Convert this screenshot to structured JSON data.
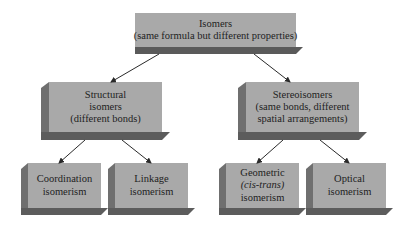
{
  "diagram": {
    "root": {
      "title": "Isomers",
      "subtitle": "(same formula but different properties)"
    },
    "structural": {
      "line1": "Structural",
      "line2": "isomers",
      "line3": "(different bonds)"
    },
    "stereo": {
      "line1": "Stereoisomers",
      "line2": "(same bonds, different",
      "line3": "spatial arrangements)"
    },
    "coordination": {
      "line1": "Coordination",
      "line2": "isomerism"
    },
    "linkage": {
      "line1": "Linkage",
      "line2": "isomerism"
    },
    "geometric": {
      "line1": "Geometric",
      "line2": "(cis-trans)",
      "line3": "isomerism"
    },
    "optical": {
      "line1": "Optical",
      "line2": "isomerism"
    },
    "edges": [
      {
        "from": "root",
        "to": "structural"
      },
      {
        "from": "root",
        "to": "stereo"
      },
      {
        "from": "structural",
        "to": "coordination"
      },
      {
        "from": "structural",
        "to": "linkage"
      },
      {
        "from": "stereo",
        "to": "geometric"
      },
      {
        "from": "stereo",
        "to": "optical"
      }
    ],
    "colors": {
      "face": "#a9a9a9",
      "side": "#6f6f6f",
      "bottom": "#5c5c5c",
      "text": "#1e1e1e",
      "arrow": "#2a2a2a"
    }
  }
}
